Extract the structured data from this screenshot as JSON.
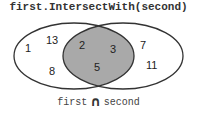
{
  "title": "first.IntersectWith(second)",
  "colors": {
    "intersection_fill": "#a9a9a9",
    "outline": "#333333",
    "background": "#ffffff"
  },
  "sets": {
    "first": {
      "name": "first",
      "only": [
        "1",
        "13",
        "8"
      ]
    },
    "second": {
      "name": "second",
      "only": [
        "7",
        "11"
      ]
    },
    "intersection": [
      "2",
      "3",
      "5"
    ]
  },
  "legend": {
    "left": "first",
    "operator_icon": "intersection-icon",
    "operator": "∩",
    "right": "second"
  }
}
